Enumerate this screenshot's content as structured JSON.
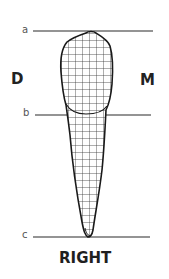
{
  "diagram": {
    "title": "RIGHT",
    "sides": {
      "left": "D",
      "right": "M"
    },
    "reference_lines": [
      {
        "label": "a",
        "y": 31,
        "x1": 33,
        "x2": 153
      },
      {
        "label": "b",
        "y": 115,
        "x1": 35,
        "x2": 151
      },
      {
        "label": "c",
        "y": 237,
        "x1": 33,
        "x2": 150
      }
    ],
    "tooth": {
      "fill_pattern": "grid",
      "grid_spacing": 7,
      "outline_color": "#1a1a1a",
      "grid_color": "#333333",
      "line_color": "#2a2a2a"
    }
  }
}
